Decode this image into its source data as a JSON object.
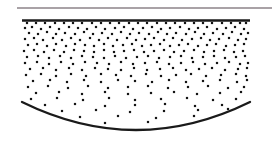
{
  "figure": {
    "canvas": {
      "width": 279,
      "height": 155,
      "background": "#ffffff"
    }
  },
  "elements": {
    "surface_line": {
      "label": "upper surface line",
      "color": "#a9a2a6",
      "x1": 17,
      "y1": 8,
      "x2": 272,
      "y2": 8,
      "thickness": 2.2
    },
    "top_boundary": {
      "label": "upper container boundary",
      "color": "#1a1a1a",
      "x1": 22,
      "y1": 20.5,
      "x2": 250,
      "y2": 20.5,
      "thickness": 2.6
    },
    "bottom_arc": {
      "label": "lower curved boundary",
      "color": "#1a1a1a",
      "x_start": 22,
      "y_start": 102,
      "x_end": 250,
      "y_end": 102,
      "x_control": 136,
      "y_control": 158,
      "thickness": 2.3
    },
    "particles": {
      "label": "particle field",
      "color": "#141414",
      "dot_size": 2.2,
      "shape": "square",
      "count_note": "density decreases with depth"
    }
  },
  "chart_data": {
    "type": "scatter",
    "xlabel": "",
    "ylabel": "",
    "xlim": [
      22,
      250
    ],
    "ylim": [
      20,
      135
    ],
    "grid": false,
    "legend": null,
    "series": [
      {
        "name": "particles",
        "marker": "square",
        "color": "#141414",
        "size": 2.2,
        "points": [
          [
            27,
            23
          ],
          [
            36,
            23
          ],
          [
            45,
            23
          ],
          [
            55,
            23
          ],
          [
            64,
            23
          ],
          [
            73,
            23
          ],
          [
            82,
            23
          ],
          [
            92,
            23
          ],
          [
            101,
            23
          ],
          [
            110,
            23
          ],
          [
            119,
            23
          ],
          [
            129,
            23
          ],
          [
            138,
            23
          ],
          [
            147,
            23
          ],
          [
            157,
            23
          ],
          [
            166,
            23
          ],
          [
            175,
            23
          ],
          [
            185,
            23
          ],
          [
            194,
            23
          ],
          [
            203,
            23
          ],
          [
            212,
            23
          ],
          [
            222,
            23
          ],
          [
            231,
            23
          ],
          [
            240,
            23
          ],
          [
            246,
            23
          ],
          [
            25,
            28
          ],
          [
            32,
            27
          ],
          [
            41,
            29
          ],
          [
            50,
            27
          ],
          [
            59,
            29
          ],
          [
            69,
            27
          ],
          [
            78,
            28
          ],
          [
            87,
            29
          ],
          [
            96,
            27
          ],
          [
            105,
            29
          ],
          [
            115,
            28
          ],
          [
            124,
            27
          ],
          [
            133,
            29
          ],
          [
            143,
            28
          ],
          [
            152,
            27
          ],
          [
            161,
            29
          ],
          [
            170,
            28
          ],
          [
            180,
            27
          ],
          [
            189,
            29
          ],
          [
            198,
            28
          ],
          [
            207,
            27
          ],
          [
            217,
            29
          ],
          [
            226,
            28
          ],
          [
            235,
            27
          ],
          [
            244,
            29
          ],
          [
            29,
            33
          ],
          [
            38,
            34
          ],
          [
            47,
            32
          ],
          [
            56,
            34
          ],
          [
            65,
            33
          ],
          [
            75,
            34
          ],
          [
            84,
            32
          ],
          [
            93,
            34
          ],
          [
            102,
            33
          ],
          [
            112,
            34
          ],
          [
            121,
            32
          ],
          [
            130,
            34
          ],
          [
            139,
            33
          ],
          [
            149,
            34
          ],
          [
            158,
            32
          ],
          [
            167,
            34
          ],
          [
            176,
            33
          ],
          [
            186,
            34
          ],
          [
            195,
            32
          ],
          [
            204,
            34
          ],
          [
            213,
            33
          ],
          [
            223,
            34
          ],
          [
            232,
            32
          ],
          [
            241,
            34
          ],
          [
            248,
            33
          ],
          [
            25,
            39
          ],
          [
            34,
            38
          ],
          [
            43,
            40
          ],
          [
            53,
            38
          ],
          [
            62,
            40
          ],
          [
            71,
            38
          ],
          [
            80,
            40
          ],
          [
            90,
            38
          ],
          [
            99,
            40
          ],
          [
            108,
            38
          ],
          [
            117,
            40
          ],
          [
            127,
            38
          ],
          [
            136,
            40
          ],
          [
            145,
            39
          ],
          [
            154,
            38
          ],
          [
            164,
            40
          ],
          [
            173,
            38
          ],
          [
            182,
            40
          ],
          [
            192,
            39
          ],
          [
            201,
            38
          ],
          [
            210,
            40
          ],
          [
            219,
            39
          ],
          [
            229,
            38
          ],
          [
            238,
            40
          ],
          [
            246,
            39
          ],
          [
            28,
            45
          ],
          [
            37,
            44
          ],
          [
            47,
            46
          ],
          [
            56,
            44
          ],
          [
            66,
            46
          ],
          [
            75,
            44
          ],
          [
            85,
            45
          ],
          [
            94,
            46
          ],
          [
            104,
            44
          ],
          [
            113,
            46
          ],
          [
            123,
            45
          ],
          [
            132,
            44
          ],
          [
            142,
            46
          ],
          [
            151,
            45
          ],
          [
            160,
            44
          ],
          [
            170,
            46
          ],
          [
            179,
            45
          ],
          [
            188,
            44
          ],
          [
            198,
            46
          ],
          [
            207,
            45
          ],
          [
            216,
            44
          ],
          [
            226,
            46
          ],
          [
            235,
            45
          ],
          [
            244,
            44
          ],
          [
            24,
            51
          ],
          [
            34,
            50
          ],
          [
            44,
            52
          ],
          [
            54,
            50
          ],
          [
            64,
            52
          ],
          [
            74,
            50
          ],
          [
            84,
            51
          ],
          [
            94,
            52
          ],
          [
            104,
            50
          ],
          [
            114,
            52
          ],
          [
            124,
            51
          ],
          [
            134,
            50
          ],
          [
            144,
            52
          ],
          [
            154,
            51
          ],
          [
            164,
            50
          ],
          [
            174,
            52
          ],
          [
            184,
            51
          ],
          [
            194,
            50
          ],
          [
            204,
            52
          ],
          [
            214,
            51
          ],
          [
            224,
            50
          ],
          [
            234,
            52
          ],
          [
            243,
            51
          ],
          [
            27,
            57
          ],
          [
            38,
            56
          ],
          [
            49,
            58
          ],
          [
            60,
            56
          ],
          [
            71,
            58
          ],
          [
            82,
            56
          ],
          [
            93,
            57
          ],
          [
            104,
            58
          ],
          [
            115,
            56
          ],
          [
            126,
            58
          ],
          [
            137,
            57
          ],
          [
            148,
            56
          ],
          [
            159,
            58
          ],
          [
            170,
            57
          ],
          [
            181,
            56
          ],
          [
            192,
            58
          ],
          [
            203,
            57
          ],
          [
            214,
            56
          ],
          [
            225,
            58
          ],
          [
            236,
            57
          ],
          [
            245,
            56
          ],
          [
            25,
            63
          ],
          [
            37,
            62
          ],
          [
            49,
            64
          ],
          [
            61,
            62
          ],
          [
            73,
            64
          ],
          [
            85,
            62
          ],
          [
            97,
            63
          ],
          [
            109,
            64
          ],
          [
            121,
            62
          ],
          [
            133,
            64
          ],
          [
            145,
            63
          ],
          [
            157,
            62
          ],
          [
            169,
            64
          ],
          [
            181,
            63
          ],
          [
            193,
            62
          ],
          [
            205,
            64
          ],
          [
            217,
            63
          ],
          [
            229,
            62
          ],
          [
            240,
            64
          ],
          [
            248,
            63
          ],
          [
            30,
            69
          ],
          [
            43,
            68
          ],
          [
            56,
            70
          ],
          [
            69,
            68
          ],
          [
            82,
            70
          ],
          [
            95,
            68
          ],
          [
            108,
            69
          ],
          [
            121,
            70
          ],
          [
            134,
            68
          ],
          [
            147,
            70
          ],
          [
            160,
            69
          ],
          [
            173,
            68
          ],
          [
            186,
            70
          ],
          [
            199,
            69
          ],
          [
            212,
            68
          ],
          [
            225,
            70
          ],
          [
            238,
            69
          ],
          [
            247,
            68
          ],
          [
            26,
            75
          ],
          [
            41,
            74
          ],
          [
            56,
            76
          ],
          [
            71,
            74
          ],
          [
            86,
            76
          ],
          [
            101,
            74
          ],
          [
            116,
            75
          ],
          [
            131,
            76
          ],
          [
            146,
            74
          ],
          [
            161,
            76
          ],
          [
            176,
            75
          ],
          [
            191,
            74
          ],
          [
            206,
            76
          ],
          [
            221,
            75
          ],
          [
            236,
            74
          ],
          [
            246,
            76
          ],
          [
            33,
            81
          ],
          [
            50,
            80
          ],
          [
            67,
            82
          ],
          [
            84,
            80
          ],
          [
            101,
            82
          ],
          [
            118,
            80
          ],
          [
            135,
            81
          ],
          [
            152,
            82
          ],
          [
            169,
            80
          ],
          [
            186,
            82
          ],
          [
            203,
            81
          ],
          [
            220,
            80
          ],
          [
            237,
            82
          ],
          [
            247,
            80
          ],
          [
            28,
            87
          ],
          [
            48,
            86
          ],
          [
            68,
            88
          ],
          [
            88,
            86
          ],
          [
            108,
            88
          ],
          [
            128,
            87
          ],
          [
            148,
            86
          ],
          [
            168,
            88
          ],
          [
            188,
            87
          ],
          [
            208,
            86
          ],
          [
            228,
            88
          ],
          [
            244,
            87
          ],
          [
            36,
            93
          ],
          [
            59,
            92
          ],
          [
            82,
            94
          ],
          [
            105,
            92
          ],
          [
            128,
            94
          ],
          [
            151,
            93
          ],
          [
            174,
            92
          ],
          [
            197,
            94
          ],
          [
            220,
            93
          ],
          [
            241,
            92
          ],
          [
            31,
            99
          ],
          [
            57,
            98
          ],
          [
            83,
            100
          ],
          [
            109,
            98
          ],
          [
            135,
            100
          ],
          [
            161,
            99
          ],
          [
            187,
            98
          ],
          [
            213,
            100
          ],
          [
            236,
            99
          ],
          [
            45,
            105
          ],
          [
            75,
            104
          ],
          [
            105,
            106
          ],
          [
            135,
            105
          ],
          [
            165,
            104
          ],
          [
            195,
            106
          ],
          [
            222,
            105
          ],
          [
            243,
            103
          ],
          [
            62,
            111
          ],
          [
            96,
            110
          ],
          [
            130,
            112
          ],
          [
            164,
            111
          ],
          [
            198,
            110
          ],
          [
            228,
            109
          ],
          [
            80,
            117
          ],
          [
            118,
            116
          ],
          [
            156,
            118
          ],
          [
            194,
            116
          ],
          [
            218,
            114
          ],
          [
            105,
            123
          ],
          [
            148,
            122
          ],
          [
            190,
            121
          ],
          [
            128,
            128
          ],
          [
            168,
            126
          ]
        ]
      }
    ]
  }
}
